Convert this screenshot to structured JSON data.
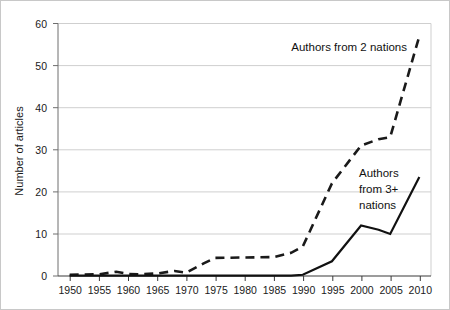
{
  "chart_data": {
    "type": "line",
    "title": "",
    "subtitle": "",
    "xlabel": "",
    "ylabel": "Number of articles",
    "xlim": [
      1948,
      2012
    ],
    "ylim": [
      0,
      60
    ],
    "grid": "horizontal",
    "legend_position": "inline-annotations",
    "y_ticks": [
      "0",
      "10",
      "20",
      "30",
      "40",
      "50",
      "60"
    ],
    "y_tick_values": [
      0,
      10,
      20,
      30,
      40,
      50,
      60
    ],
    "x_ticks": [
      "1950",
      "1955",
      "1960",
      "1965",
      "1970",
      "1975",
      "1980",
      "1985",
      "1990",
      "1995",
      "2000",
      "2005",
      "2010"
    ],
    "x_tick_values": [
      1950,
      1955,
      1960,
      1965,
      1970,
      1975,
      1980,
      1985,
      1990,
      1995,
      2000,
      2005,
      2010
    ],
    "x": [
      1950,
      1955,
      1958,
      1960,
      1962,
      1965,
      1968,
      1970,
      1973,
      1975,
      1980,
      1985,
      1988,
      1990,
      1995,
      2000,
      2003,
      2005,
      2010
    ],
    "series": [
      {
        "name": "Authors from 2 nations",
        "style": "dashed",
        "color": "#1a1a1a",
        "values": [
          0.3,
          0.4,
          1.0,
          0.5,
          0.4,
          0.6,
          1.2,
          0.8,
          3.0,
          4.3,
          4.4,
          4.5,
          5.5,
          7.0,
          22.0,
          31.0,
          32.5,
          33.0,
          57.0
        ]
      },
      {
        "name": "Authors from 3+ nations",
        "style": "solid",
        "color": "#111111",
        "values": [
          0.1,
          0.1,
          0.1,
          0.1,
          0.1,
          0.1,
          0.1,
          0.1,
          0.1,
          0.1,
          0.1,
          0.1,
          0.1,
          0.3,
          3.5,
          12.0,
          11.0,
          10.0,
          23.5
        ]
      }
    ],
    "annotations": [
      {
        "name": "label-authors-2-nations",
        "text": "Authors from 2 nations",
        "lines": [
          "Authors from 2 nations"
        ],
        "x": 2007,
        "y": 52
      },
      {
        "name": "label-authors-3plus-nations",
        "text": "Authors from 3+ nations",
        "lines": [
          "Authors",
          "from 3+",
          "nations"
        ],
        "x": 2001,
        "y": 26
      }
    ]
  },
  "annotation_a_line1": "Authors from 2 nations",
  "annotation_b_line1": "Authors",
  "annotation_b_line2": "from 3+",
  "annotation_b_line3": "nations"
}
